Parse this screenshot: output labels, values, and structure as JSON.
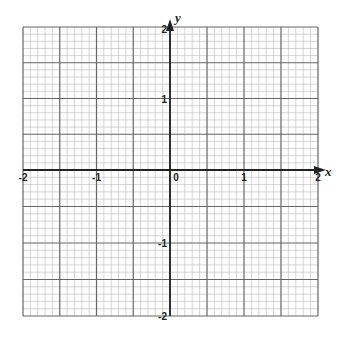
{
  "chart_data": {
    "type": "line",
    "title": "",
    "xlabel": "x",
    "ylabel": "y",
    "xlim": [
      -2,
      2
    ],
    "ylim": [
      -2,
      2
    ],
    "grid": true,
    "major_step": 0.5,
    "minor_step": 0.1,
    "x_ticks": [
      {
        "value": -2,
        "label": "-2"
      },
      {
        "value": -1,
        "label": "-1"
      },
      {
        "value": 0,
        "label": "0"
      },
      {
        "value": 1,
        "label": "1"
      },
      {
        "value": 2,
        "label": "2"
      }
    ],
    "y_ticks": [
      {
        "value": 2,
        "label": "2"
      },
      {
        "value": 1,
        "label": "1"
      },
      {
        "value": -1,
        "label": "-1"
      },
      {
        "value": -2,
        "label": "-2"
      }
    ],
    "series": [],
    "colors": {
      "minor_grid": "#b8b8b8",
      "major_grid": "#666666",
      "axis": "#222222"
    }
  }
}
